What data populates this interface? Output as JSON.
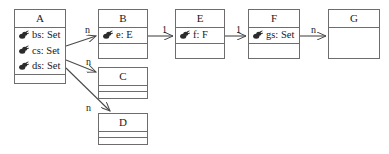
{
  "diagram": {
    "kind": "uml-class-diagram",
    "width": 389,
    "height": 154,
    "background_color": "#ffffff",
    "line_color": "#6d6d6d",
    "text_color": "#1a1a1a"
  },
  "classes": [
    {
      "id": "A",
      "name": "A",
      "attributes": [
        {
          "icon": "association-end-icon",
          "label": "bs: Set"
        },
        {
          "icon": "association-end-icon",
          "label": "cs: Set"
        },
        {
          "icon": "association-end-icon",
          "label": "ds: Set"
        }
      ],
      "has_empty_compartment": true,
      "box": {
        "x": 14,
        "y": 9,
        "w": 52,
        "h": 75
      }
    },
    {
      "id": "B",
      "name": "B",
      "attributes": [
        {
          "icon": "association-end-icon",
          "label": "e: E"
        }
      ],
      "has_empty_compartment": true,
      "box": {
        "x": 98,
        "y": 9,
        "w": 50,
        "h": 50
      }
    },
    {
      "id": "E",
      "name": "E",
      "attributes": [
        {
          "icon": "association-end-icon",
          "label": "f: F"
        }
      ],
      "has_empty_compartment": true,
      "box": {
        "x": 175,
        "y": 9,
        "w": 50,
        "h": 50
      }
    },
    {
      "id": "F",
      "name": "F",
      "attributes": [
        {
          "icon": "association-end-icon",
          "label": "gs: Set"
        }
      ],
      "has_empty_compartment": true,
      "box": {
        "x": 248,
        "y": 9,
        "w": 52,
        "h": 50
      }
    },
    {
      "id": "G",
      "name": "G",
      "attributes": [],
      "has_empty_compartment": true,
      "box": {
        "x": 328,
        "y": 9,
        "w": 52,
        "h": 50
      }
    },
    {
      "id": "C",
      "name": "C",
      "attributes": [],
      "has_empty_compartment": true,
      "box": {
        "x": 98,
        "y": 67,
        "w": 50,
        "h": 32
      }
    },
    {
      "id": "D",
      "name": "D",
      "attributes": [],
      "has_empty_compartment": true,
      "box": {
        "x": 98,
        "y": 113,
        "w": 50,
        "h": 32
      }
    }
  ],
  "edges": [
    {
      "id": "a-to-b",
      "from": "A",
      "to": "B",
      "multiplicity": "n",
      "label_pos": {
        "x": 85,
        "y": 25
      }
    },
    {
      "id": "b-to-e",
      "from": "B",
      "to": "E",
      "multiplicity": "1",
      "label_pos": {
        "x": 162,
        "y": 25
      }
    },
    {
      "id": "e-to-f",
      "from": "E",
      "to": "F",
      "multiplicity": "1",
      "label_pos": {
        "x": 236,
        "y": 25
      }
    },
    {
      "id": "f-to-g",
      "from": "F",
      "to": "G",
      "multiplicity": "n",
      "label_pos": {
        "x": 311,
        "y": 25
      }
    },
    {
      "id": "a-to-c",
      "from": "A",
      "to": "C",
      "multiplicity": "n",
      "label_pos": {
        "x": 86,
        "y": 57
      }
    },
    {
      "id": "a-to-d",
      "from": "A",
      "to": "D",
      "multiplicity": "n",
      "label_pos": {
        "x": 86,
        "y": 103
      }
    }
  ]
}
